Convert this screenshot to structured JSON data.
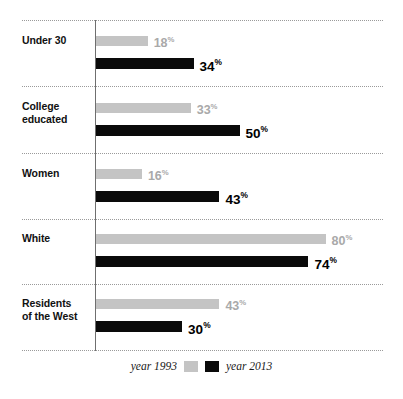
{
  "chart_data": {
    "type": "bar",
    "orientation": "horizontal",
    "title": "",
    "xlabel": "",
    "ylabel": "",
    "xlim": [
      0,
      100
    ],
    "grid": true,
    "legend_position": "bottom-center",
    "categories": [
      "Under 30",
      "College educated",
      "Women",
      "White",
      "Residents of the West"
    ],
    "series": [
      {
        "name": "year 1993",
        "color": "#c4c4c4",
        "values": [
          18,
          33,
          16,
          80,
          43
        ]
      },
      {
        "name": "year 2013",
        "color": "#0a0a0a",
        "values": [
          34,
          50,
          43,
          74,
          30
        ]
      }
    ],
    "value_suffix": "%"
  },
  "groups": [
    {
      "label_line1": "Under 30",
      "label_line2": "",
      "v1993": 18,
      "v2013": 34,
      "t1993": "18",
      "t2013": "34"
    },
    {
      "label_line1": "College",
      "label_line2": "educated",
      "v1993": 33,
      "v2013": 50,
      "t1993": "33",
      "t2013": "50"
    },
    {
      "label_line1": "Women",
      "label_line2": "",
      "v1993": 16,
      "v2013": 43,
      "t1993": "16",
      "t2013": "43"
    },
    {
      "label_line1": "White",
      "label_line2": "",
      "v1993": 80,
      "v2013": 74,
      "t1993": "80",
      "t2013": "74"
    },
    {
      "label_line1": "Residents",
      "label_line2": "of the West",
      "v1993": 43,
      "v2013": 30,
      "t1993": "43",
      "t2013": "30"
    }
  ],
  "legend": {
    "left_label": "year 1993",
    "right_label": "year 2013",
    "left_color": "#c4c4c4",
    "right_color": "#0a0a0a"
  },
  "percent_symbol": "%"
}
